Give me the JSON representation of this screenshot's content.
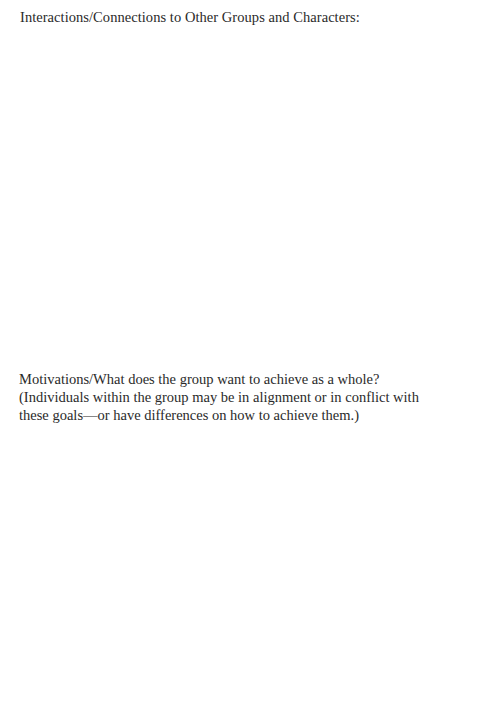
{
  "sections": [
    {
      "heading": "Interactions/Connections to Other Groups and Characters:",
      "answer": ""
    },
    {
      "prompt_lines": [
        "Motivations/What does the group want to achieve as a whole?",
        "(Individuals within the group may be in alignment or in conflict with",
        "these goals—or have differences on how to achieve them.)"
      ],
      "answer": ""
    }
  ]
}
